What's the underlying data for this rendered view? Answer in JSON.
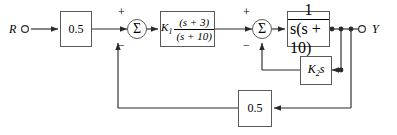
{
  "diagram": {
    "input_label": "R",
    "output_label": "Y",
    "blocks": {
      "input_gain": {
        "label": "0.5"
      },
      "controller": {
        "gain": "K",
        "gain_sub": "1",
        "numerator": "(s + 3)",
        "denominator": "(s + 10)"
      },
      "plant": {
        "numerator": "1",
        "denominator": "s(s + 10)"
      },
      "rate_feedback": {
        "gain": "K",
        "gain_sub": "2",
        "variable": "s"
      },
      "output_feedback": {
        "label": "0.5"
      }
    },
    "summers": {
      "first": {
        "symbol": "Σ",
        "plus": "+",
        "minus": "−"
      },
      "second": {
        "symbol": "Σ",
        "plus": "+",
        "minus": "−"
      }
    },
    "colors": {
      "line": "#2b2b2b",
      "block_border": "#5a5a5a",
      "background": "#ffffff"
    }
  }
}
